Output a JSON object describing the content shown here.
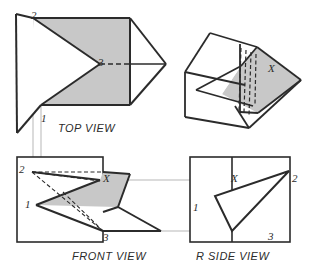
{
  "drawing": {
    "title_present": false,
    "colors": {
      "paper": "#ffffff",
      "ink": "#2b2b2b",
      "shade": "#c8c8c8",
      "thin": "#9a9a9a",
      "hidden": "#3a3a3a"
    },
    "view_labels": [
      {
        "name": "top-view-label",
        "text": "TOP  VIEW",
        "x": 58,
        "y": 122
      },
      {
        "name": "front-view-label",
        "text": "FRONT  VIEW",
        "x": 72,
        "y": 256
      },
      {
        "name": "r-side-view-label",
        "text": "R  SIDE  VIEW",
        "x": 196,
        "y": 256
      }
    ],
    "point_labels": [
      {
        "name": "top-view-point-2",
        "text": "2",
        "x": 31,
        "y": 10
      },
      {
        "name": "top-view-point-3",
        "text": "3",
        "x": 98,
        "y": 61
      },
      {
        "name": "top-view-point-1",
        "text": "1",
        "x": 41,
        "y": 117
      },
      {
        "name": "pictorial-point-x",
        "text": "X",
        "x": 270,
        "y": 67
      },
      {
        "name": "front-view-point-2",
        "text": "2",
        "x": 19,
        "y": 165
      },
      {
        "name": "front-view-point-x",
        "text": "X",
        "x": 104,
        "y": 178
      },
      {
        "name": "front-view-point-1",
        "text": "1",
        "x": 25,
        "y": 203
      },
      {
        "name": "front-view-point-3",
        "text": "3",
        "x": 103,
        "y": 236
      },
      {
        "name": "side-view-point-x",
        "text": "X",
        "x": 232,
        "y": 178
      },
      {
        "name": "side-view-point-2",
        "text": "2",
        "x": 293,
        "y": 177
      },
      {
        "name": "side-view-point-1",
        "text": "1",
        "x": 194,
        "y": 207
      },
      {
        "name": "side-view-point-3",
        "text": "3",
        "x": 269,
        "y": 235
      }
    ],
    "top_view": {
      "shaded_polygon": "33,18 130,18 130,105 41,105 100,64",
      "outline_polygon": "16,14 33,18 130,18 130,105 41,105 17,133",
      "sheet_left_edge": "16,14 17,133",
      "sheet_left_fold_top": "16,14 33,18",
      "sheet_left_fold_bottom": "17,133 41,105",
      "flap_outline": "130,18 166,64 130,105",
      "flap_top_edge": "130,18 166,64",
      "flap_bottom_edge": "166,64 130,105",
      "solid_edge_3": "130,64 166,64",
      "hidden_edge_3": "100,64 130,64",
      "plate_right_edge": "130,18 130,105",
      "vertex_12": "33,18 100,64",
      "vertex_13": "100,64 41,105"
    },
    "front_view": {
      "frame_rect": {
        "x": 17,
        "y": 157,
        "w": 86,
        "h": 85
      },
      "shaded_polygon": "32,172 103,172 103,231 36,205 100,180",
      "plate_polygon": "103,172 130,174 118,207 103,231",
      "lower_flap": "36,205 103,231 161,231 118,207",
      "edge_1_to_x": "36,205 100,180",
      "edge_x_to_2": "100,180 32,172",
      "edge_1_to_3": "36,205 103,231",
      "edge_3_to_right": "103,231 161,231",
      "edge_right_up": "161,231 118,207",
      "edge_flapfold": "118,207 130,174",
      "edge_top_right": "103,172 130,174",
      "hidden_2_to_x": "32,172 100,180",
      "hidden_2_to_3": "32,172 103,231",
      "hidden_2_to_mid": "32,172 103,172",
      "hidden_1_to_3b": "36,205 103,231"
    },
    "r_side_view": {
      "frame_rect": {
        "x": 190,
        "y": 157,
        "w": 100,
        "h": 85
      },
      "center_fold_x": 232,
      "triangle": "289,171 215,196 232,231",
      "edge_1_to_2": "215,196 289,171",
      "edge_2_to_3": "289,171 232,231",
      "edge_3_to_1": "232,231 215,196"
    },
    "projection_lines": {
      "vertical": [
        "33,18 33,172",
        "41,105 41,205"
      ],
      "horizontal": [
        "103,180 290,180",
        "103,231 290,231"
      ]
    },
    "pictorial": {
      "back_plate": "185,72 210,33 258,48 248,114 185,117",
      "back_plate_top": "185,72 210,33",
      "back_plate_top_right": "210,33 258,48",
      "shaded_polygon": "258,48 300,80 258,113 222,93 240,66",
      "front_flap": "258,48 300,80 248,128 232,104",
      "hidden_lines": [
        "238,44 238,108",
        "243,46 243,110",
        "248,48 248,112",
        "253,50 253,114"
      ],
      "lower_edges": [
        "185,117 248,128",
        "196,91 252,104",
        "248,114 252,104"
      ]
    }
  }
}
